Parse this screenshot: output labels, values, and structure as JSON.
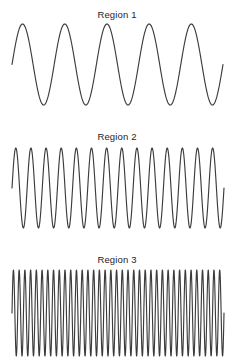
{
  "figure": {
    "width": 234,
    "height": 361,
    "background": "#ffffff",
    "line_color": "#3c3c3c",
    "text_color": "#1d1d1d"
  },
  "chart_data": {
    "type": "line",
    "title": "",
    "xlabel": "",
    "ylabel": "",
    "grid": false,
    "legend": null,
    "panels": [
      {
        "label": "Region 1",
        "title_y": 9,
        "wave_type": "sine",
        "cycles": 5,
        "x_start": 12,
        "x_end": 223,
        "peak_y": 24,
        "trough_y": 105,
        "center_y": 64.5,
        "amplitude": 40.5,
        "phase": "rising-from-zero",
        "samples": 480
      },
      {
        "label": "Region 2",
        "title_y": 131,
        "wave_type": "sine",
        "cycles": 14,
        "x_start": 12,
        "x_end": 224,
        "peak_y": 148,
        "trough_y": 228,
        "center_y": 188,
        "amplitude": 40,
        "phase": "rising-from-zero",
        "samples": 900
      },
      {
        "label": "Region 3",
        "title_y": 254,
        "wave_type": "sine",
        "cycles": 37,
        "x_start": 12,
        "x_end": 224,
        "peak_y": 270,
        "trough_y": 356,
        "center_y": 313,
        "amplitude": 43,
        "phase": "rising-from-zero",
        "samples": 1800
      }
    ]
  }
}
